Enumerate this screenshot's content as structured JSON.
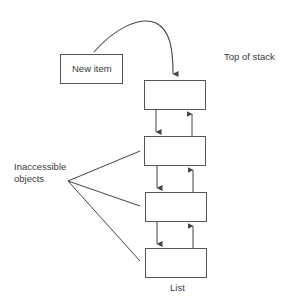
{
  "diagram": {
    "type": "stack-linked-list",
    "new_item_label": "New item",
    "top_label": "Top of stack",
    "inaccessible_label_line1": "Inaccessible",
    "inaccessible_label_line2": "objects",
    "list_label": "List",
    "nodes": [
      {
        "id": "node-1",
        "position": "top"
      },
      {
        "id": "node-2"
      },
      {
        "id": "node-3"
      },
      {
        "id": "node-4",
        "position": "bottom"
      }
    ],
    "colors": {
      "stroke": "#444444",
      "text": "#3a3a3a",
      "background": "#ffffff"
    }
  }
}
